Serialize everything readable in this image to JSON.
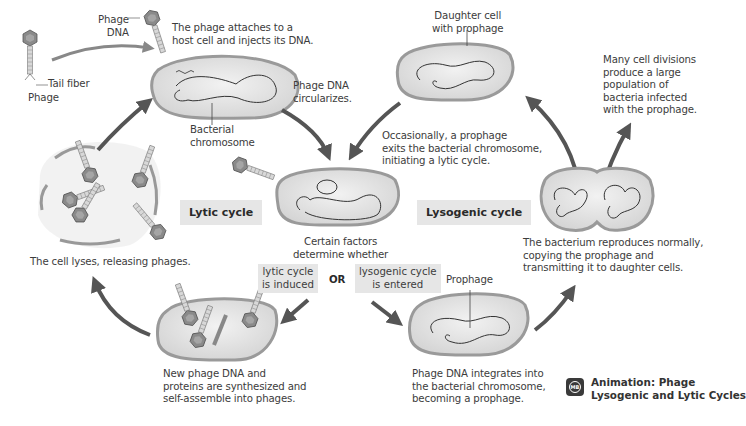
{
  "labels": {
    "phage_dna": "Phage\nDNA",
    "attach": "The phage attaches to a\nhost cell and injects its DNA.",
    "tail_fiber": "Tail fiber",
    "phage": "Phage",
    "bacterial_chromosome": "Bacterial\nchromosome",
    "circularizes": "Phage DNA\ncircularizes.",
    "daughter_cell": "Daughter cell\nwith prophage",
    "many_divisions": "Many cell divisions\nproduce a large\npopulation of\nbacteria infected\nwith the prophage.",
    "occasionally": "Occasionally, a prophage\nexits the bacterial chromosome,\ninitiating a lytic cycle.",
    "lytic_cycle": "Lytic cycle",
    "lysogenic_cycle": "Lysogenic cycle",
    "cell_lyses": "The cell lyses, releasing phages.",
    "certain_factors": "Certain factors\ndetermine whether",
    "lytic_induced": "lytic cycle\nis induced",
    "or": "OR",
    "lysogenic_entered": "lysogenic cycle\nis entered",
    "prophage": "Prophage",
    "reproduces": "The bacterium reproduces normally,\ncopying the prophage and\ntransmitting it to daughter cells.",
    "new_phage": "New phage DNA and\nproteins are synthesized and\nself-assemble into phages.",
    "integrates": "Phage DNA integrates into\nthe bacterial chromosome,\nbecoming a prophage."
  },
  "animation": {
    "icon": "mb-play-icon",
    "badge": "MB",
    "title": "Animation: Phage\nLysogenic and Lytic Cycles"
  },
  "colors": {
    "arrow": "#555555",
    "cell_fill": "#e4e4e4",
    "cell_wall": "#a8a8a8",
    "label_box": "#e6e6e6"
  }
}
